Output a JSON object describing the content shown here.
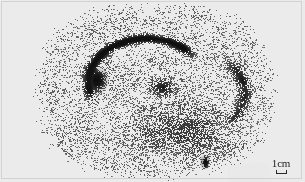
{
  "figure": {
    "kind": "scintigram-autoradiograph",
    "width": 305,
    "height": 182,
    "background_color": "#ebebeb",
    "border_color": "#d2d2d2",
    "speckle_color": "#1a1a1a",
    "plate_tone": "#e9e9e9"
  },
  "scale_bar": {
    "label": "1cm",
    "bracket_color": "#2a2a2a"
  },
  "chart_data": {
    "type": "heatmap",
    "title": "",
    "xlabel": "",
    "ylabel": "",
    "grid": false,
    "legend": "none",
    "annotations": [
      {
        "text": "1cm",
        "x": 283,
        "y": 158,
        "role": "scale-bar"
      }
    ],
    "field": {
      "description": "stochastic dot-density counting field (gamma camera / autoradiograph speckle)",
      "x_extent": [
        42,
        268
      ],
      "y_extent": [
        8,
        174
      ],
      "baseline_density": 0.2,
      "dot_size_px": [
        1,
        2
      ]
    },
    "features": [
      {
        "name": "crescent-arc-uptake",
        "shape": "arc",
        "cx": 146,
        "cy": 82,
        "rx": 58,
        "ry": 44,
        "start_deg": 150,
        "end_deg": 330,
        "thickness": 7,
        "intensity": 0.95
      },
      {
        "name": "dense-focal-blob-left",
        "shape": "blob",
        "cx": 96,
        "cy": 80,
        "rx": 11,
        "ry": 15,
        "intensity": 1.0
      },
      {
        "name": "central-cluster",
        "shape": "blob",
        "cx": 162,
        "cy": 87,
        "rx": 18,
        "ry": 14,
        "intensity": 0.8
      },
      {
        "name": "right-shoulder-band",
        "shape": "arc",
        "cx": 196,
        "cy": 92,
        "rx": 48,
        "ry": 40,
        "start_deg": 300,
        "end_deg": 60,
        "thickness": 9,
        "intensity": 0.6
      },
      {
        "name": "lower-right-dark-spot",
        "shape": "blob",
        "cx": 205,
        "cy": 162,
        "rx": 4,
        "ry": 8,
        "intensity": 1.0
      },
      {
        "name": "lower-diffuse-field",
        "shape": "blob",
        "cx": 180,
        "cy": 130,
        "rx": 70,
        "ry": 36,
        "intensity": 0.45
      }
    ]
  }
}
